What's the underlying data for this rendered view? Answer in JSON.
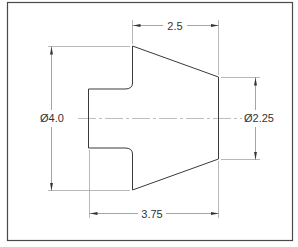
{
  "drawing": {
    "title": "Turned part dimension drawing",
    "dimensions": {
      "top_length": "2.5",
      "overall_length": "3.75",
      "left_diameter": "Ø4.0",
      "right_diameter": "Ø2.25"
    },
    "colors": {
      "outline": "#3a3a3a",
      "dimension": "#555555",
      "centerline": "#9a9a9a",
      "border": "#4a4a4a"
    }
  }
}
